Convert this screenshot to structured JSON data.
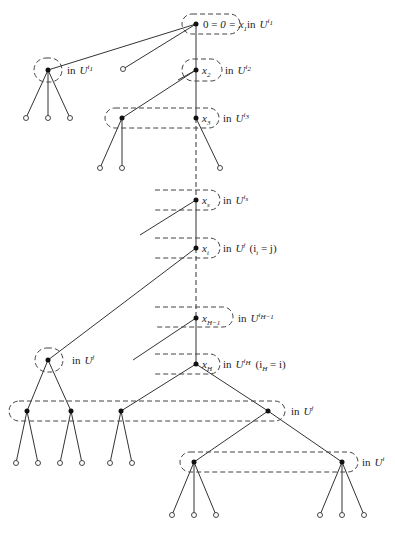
{
  "diagram": {
    "type": "game-tree",
    "path_nodes": [
      {
        "id": "x1",
        "label": "0 = x",
        "sub": "1",
        "in_text": "in",
        "set": "U",
        "set_sup": "i",
        "set_sup_sub": "1"
      },
      {
        "id": "x2",
        "label": "x",
        "sub": "2",
        "in_text": "in",
        "set": "U",
        "set_sup": "i",
        "set_sup_sub": "2"
      },
      {
        "id": "x3",
        "label": "x",
        "sub": "3",
        "in_text": "in",
        "set": "U",
        "set_sup": "i",
        "set_sup_sub": "3"
      },
      {
        "id": "xs",
        "label": "x",
        "sub": "s",
        "in_text": "in",
        "set": "U",
        "set_sup": "i",
        "set_sup_sub": "s"
      },
      {
        "id": "xt",
        "label": "x",
        "sub": "t",
        "in_text": "in",
        "set": "U",
        "set_sup": "j",
        "extra": "(i",
        "extra_sub": "t",
        "extra_rest": " = j)"
      },
      {
        "id": "xH-1",
        "label": "x",
        "sub": "H−1",
        "in_text": "in",
        "set": "U",
        "set_sup": "i",
        "set_sup_sub": "H−1"
      },
      {
        "id": "xH",
        "label": "x",
        "sub": "H",
        "in_text": "in",
        "set": "U",
        "set_sup": "i",
        "set_sup_sub": "H",
        "extra": "(i",
        "extra_sub": "H",
        "extra_rest": " = i)"
      }
    ],
    "side_sets": [
      {
        "id": "left-top",
        "in_text": "in",
        "set": "U",
        "set_sup": "i",
        "set_sup_sub": "1"
      },
      {
        "id": "left-mid",
        "in_text": "in",
        "set": "U",
        "set_sup": "j"
      },
      {
        "id": "bottom-wide",
        "in_text": "in",
        "set": "U",
        "set_sup": "j"
      },
      {
        "id": "bottom-right",
        "in_text": "in",
        "set": "U",
        "set_sup": "i"
      }
    ]
  }
}
